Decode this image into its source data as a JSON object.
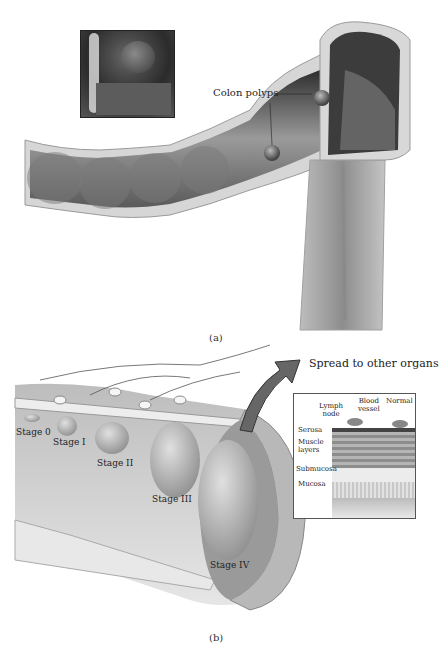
{
  "panel_a": {
    "caption": "(a)",
    "labels": {
      "colon_polyps": "Colon polyps"
    },
    "inset_photo": "endoscopic-photo-of-polyp"
  },
  "panel_b": {
    "caption": "(b)",
    "arrow_label": "Spread to other organs",
    "stages": [
      "Stage 0",
      "Stage I",
      "Stage II",
      "Stage III",
      "Stage IV"
    ],
    "inset": {
      "top_labels": {
        "lymph_node": "Lymph\nnode",
        "blood_vessel": "Blood\nvessel",
        "normal": "Normal"
      },
      "layers": [
        "Serosa",
        "Muscle layers",
        "Submucosa",
        "Mucosa"
      ]
    }
  },
  "colors": {
    "tissue_dark": "#3a3a3a",
    "tissue_mid": "#8a8a8a",
    "tissue_light": "#d8d8d8",
    "wall": "#c9c9c9"
  }
}
